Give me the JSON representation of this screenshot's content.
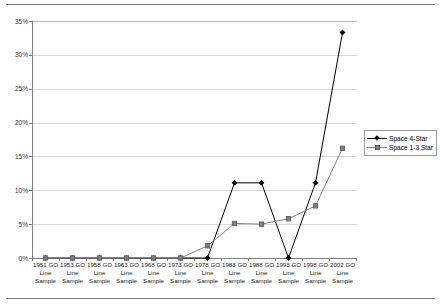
{
  "chart_data": {
    "type": "line",
    "title": "",
    "xlabel": "",
    "ylabel": "",
    "ylim": [
      0,
      35
    ],
    "ytick_labels": [
      "35%",
      "30%",
      "25%",
      "20%",
      "15%",
      "10%",
      "5%",
      "0%"
    ],
    "ytick_values": [
      35,
      30,
      25,
      20,
      15,
      10,
      5,
      0
    ],
    "grid": true,
    "legend_position": "right",
    "categories": [
      "1951 GO\nLine\nSample",
      "1953 GO\nLine\nSample",
      "1958 GO\nLine\nSample",
      "1963 GO\nLine\nSample",
      "1968 GO\nLine\nSample",
      "1973 GO\nLine\nSample",
      "1978 GO\nLine\nSample",
      "1983 GO\nLine\nSample",
      "1988 GO\nLine\nSample",
      "1993 GO\nLine\nSample",
      "1998 GO\nLine\nSample",
      "2002 GO\nLine\nSample"
    ],
    "series": [
      {
        "name": "Space 4-Star",
        "color": "#000000",
        "marker": "diamond",
        "values": [
          0,
          0,
          0,
          0,
          0,
          0,
          0,
          11.1,
          11.1,
          0,
          11.1,
          33.3
        ]
      },
      {
        "name": "Space 1-3 Star",
        "color": "#808080",
        "marker": "square",
        "values": [
          0,
          0,
          0,
          0,
          0,
          0,
          1.8,
          5.1,
          5.0,
          5.8,
          7.7,
          16.2
        ]
      }
    ]
  },
  "legend": {
    "items": [
      {
        "label": "Space 4-Star"
      },
      {
        "label": "Space 1-3 Star"
      }
    ]
  },
  "colors": {
    "series_dark": "#000000",
    "series_gray": "#808080",
    "gridline": "#d9d9d9",
    "axis": "#808080",
    "rule": "#7a7a7a"
  }
}
